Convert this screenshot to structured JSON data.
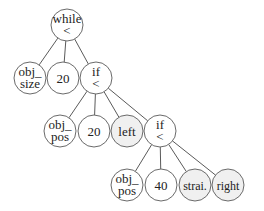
{
  "diagram": {
    "type": "tree",
    "colors": {
      "leaf_fill": "#f0f0f0",
      "node_fill": "#ffffff",
      "stroke": "#6a6a6a"
    },
    "nodes": [
      {
        "id": "n0",
        "lines": [
          "while",
          "<"
        ],
        "x": 67,
        "y": 25,
        "fill": "#ffffff"
      },
      {
        "id": "n1",
        "lines": [
          "obj_",
          "size"
        ],
        "x": 30,
        "y": 78,
        "fill": "#ffffff"
      },
      {
        "id": "n2",
        "lines": [
          "20"
        ],
        "x": 63,
        "y": 78,
        "fill": "#ffffff"
      },
      {
        "id": "n3",
        "lines": [
          "if",
          "<"
        ],
        "x": 96,
        "y": 78,
        "fill": "#ffffff"
      },
      {
        "id": "n4",
        "lines": [
          "obj_",
          "pos"
        ],
        "x": 60,
        "y": 131,
        "fill": "#ffffff"
      },
      {
        "id": "n5",
        "lines": [
          "20"
        ],
        "x": 94,
        "y": 131,
        "fill": "#ffffff"
      },
      {
        "id": "n6",
        "lines": [
          "left"
        ],
        "x": 127,
        "y": 131,
        "fill": "#f0f0f0"
      },
      {
        "id": "n7",
        "lines": [
          "if",
          "<"
        ],
        "x": 160,
        "y": 131,
        "fill": "#ffffff"
      },
      {
        "id": "n8",
        "lines": [
          "obj_",
          "pos"
        ],
        "x": 127,
        "y": 185,
        "fill": "#ffffff"
      },
      {
        "id": "n9",
        "lines": [
          "40"
        ],
        "x": 161,
        "y": 185,
        "fill": "#ffffff"
      },
      {
        "id": "n10",
        "lines": [
          "strai."
        ],
        "x": 195,
        "y": 185,
        "fill": "#f0f0f0"
      },
      {
        "id": "n11",
        "lines": [
          "right"
        ],
        "x": 228,
        "y": 185,
        "fill": "#f0f0f0"
      }
    ],
    "edges": [
      [
        "n0",
        "n1"
      ],
      [
        "n0",
        "n2"
      ],
      [
        "n0",
        "n3"
      ],
      [
        "n3",
        "n4"
      ],
      [
        "n3",
        "n5"
      ],
      [
        "n3",
        "n6"
      ],
      [
        "n3",
        "n7"
      ],
      [
        "n7",
        "n8"
      ],
      [
        "n7",
        "n9"
      ],
      [
        "n7",
        "n10"
      ],
      [
        "n7",
        "n11"
      ]
    ],
    "radius": 16
  }
}
